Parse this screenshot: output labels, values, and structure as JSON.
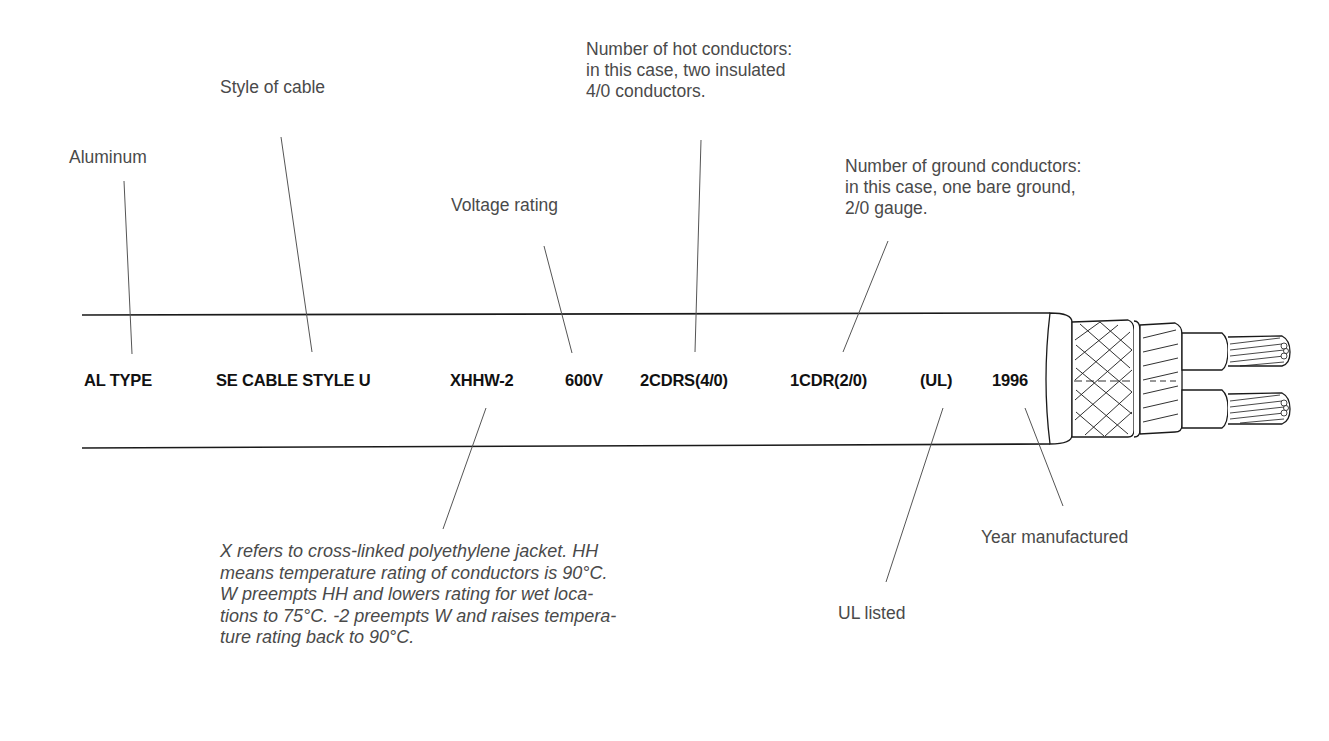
{
  "diagram": {
    "cable_markings": [
      {
        "id": "al-type",
        "text": "AL TYPE",
        "x": 84
      },
      {
        "id": "se-cable-style",
        "text": "SE CABLE STYLE U",
        "x": 216
      },
      {
        "id": "insulation-type",
        "text": "XHHW-2",
        "x": 450
      },
      {
        "id": "voltage",
        "text": "600V",
        "x": 565
      },
      {
        "id": "hot-conductors",
        "text": "2CDRS(4/0)",
        "x": 640
      },
      {
        "id": "ground-conductors",
        "text": "1CDR(2/0)",
        "x": 790
      },
      {
        "id": "ul",
        "text": "(UL)",
        "x": 920
      },
      {
        "id": "year",
        "text": "1996",
        "x": 992
      }
    ],
    "callouts": {
      "aluminum": "Aluminum",
      "style_of_cable": "Style of cable",
      "voltage_rating": "Voltage rating",
      "hot_conductors": "Number of hot conductors:\nin this case, two insulated\n4/0 conductors.",
      "ground_conductors": "Number of ground conductors:\nin this case, one bare ground,\n2/0 gauge.",
      "insulation_note": "X refers to cross-linked polyethylene jacket. HH\nmeans temperature rating of conductors is 90°C.\nW preempts HH and lowers rating for wet loca-\ntions to 75°C. -2 preempts W and raises tempera-\nture rating back to 90°C.",
      "ul_listed": "UL listed",
      "year_manufactured": "Year manufactured"
    },
    "colors": {
      "line": "#1a1a1a",
      "leader": "#555555",
      "callout_text": "#4a4a4a",
      "marking_text": "#111111"
    }
  }
}
